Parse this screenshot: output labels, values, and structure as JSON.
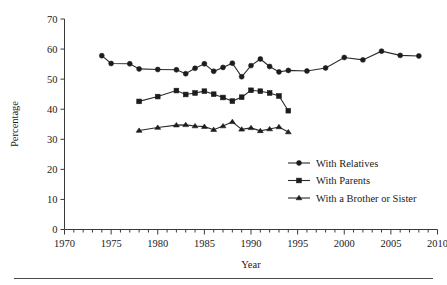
{
  "chart_data": {
    "type": "line",
    "title": "",
    "xlabel": "Year",
    "ylabel": "Percentage",
    "xlim": [
      1970,
      2010
    ],
    "ylim": [
      0,
      70
    ],
    "xticks": [
      1970,
      1975,
      1980,
      1985,
      1990,
      1995,
      2000,
      2005,
      2010
    ],
    "yticks": [
      0,
      10,
      20,
      30,
      40,
      50,
      60,
      70
    ],
    "minor_xtick_step": 1,
    "grid": false,
    "legend_position": "center-right",
    "series": [
      {
        "name": "With Relatives",
        "marker": "circle",
        "x": [
          1974,
          1975,
          1977,
          1978,
          1980,
          1982,
          1983,
          1984,
          1985,
          1986,
          1987,
          1988,
          1989,
          1990,
          1991,
          1992,
          1993,
          1994,
          1996,
          1998,
          2000,
          2002,
          2004,
          2006,
          2008
        ],
        "y": [
          57.8,
          55.2,
          55.1,
          53.4,
          53.2,
          53.1,
          51.8,
          53.6,
          55.1,
          52.6,
          53.9,
          55.3,
          50.8,
          54.5,
          56.7,
          54.2,
          52.4,
          52.9,
          52.7,
          53.7,
          57.2,
          56.4,
          59.3,
          57.9,
          57.7
        ]
      },
      {
        "name": "With Parents",
        "marker": "square",
        "x": [
          1978,
          1980,
          1982,
          1983,
          1984,
          1985,
          1986,
          1987,
          1988,
          1989,
          1990,
          1991,
          1992,
          1993,
          1994
        ],
        "y": [
          42.6,
          44.2,
          46.2,
          44.9,
          45.4,
          46.0,
          45.0,
          43.9,
          42.7,
          44.0,
          46.3,
          46.0,
          45.4,
          44.4,
          39.5
        ]
      },
      {
        "name": "With a Brother or Sister",
        "marker": "triangle",
        "x": [
          1978,
          1980,
          1982,
          1983,
          1984,
          1985,
          1986,
          1987,
          1988,
          1989,
          1990,
          1991,
          1992,
          1993,
          1994
        ],
        "y": [
          32.9,
          33.9,
          34.7,
          34.8,
          34.4,
          34.2,
          33.2,
          34.4,
          35.8,
          33.3,
          33.8,
          32.8,
          33.4,
          34.1,
          32.4
        ]
      }
    ]
  },
  "legend": {
    "entries": [
      {
        "label": "With Relatives"
      },
      {
        "label": "With Parents"
      },
      {
        "label": "With a Brother or Sister"
      }
    ]
  }
}
